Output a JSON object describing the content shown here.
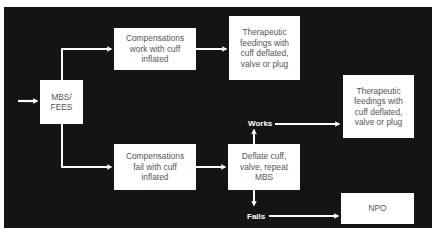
{
  "diagram": {
    "background_color": "#141414",
    "box_color": "#ffffff",
    "text_color": "#555555",
    "arrow_color": "#ffffff",
    "nodes": {
      "start": {
        "label": "MBS/\nFEES"
      },
      "comp_work": {
        "label": "Compensations\nwork with cuff\ninflated"
      },
      "thera_top": {
        "label": "Therapeutic\nfeedings with\ncuff deflated,\nvalve or plug"
      },
      "comp_fail": {
        "label": "Compensations\nfail with cuff\ninflated"
      },
      "deflate": {
        "label": "Deflate cuff,\nvalve, repeat\nMBS"
      },
      "thera_right": {
        "label": "Therapeutic\nfeedings with\ncuff deflated,\nvalve or plug"
      },
      "npo": {
        "label": "NPO"
      }
    },
    "edge_labels": {
      "works": "Works",
      "fails": "Fails"
    },
    "edges": [
      {
        "from": "entry",
        "to": "start"
      },
      {
        "from": "start",
        "to": "comp_work"
      },
      {
        "from": "start",
        "to": "comp_fail"
      },
      {
        "from": "comp_work",
        "to": "thera_top"
      },
      {
        "from": "comp_fail",
        "to": "deflate"
      },
      {
        "from": "deflate",
        "to": "thera_right",
        "label": "Works"
      },
      {
        "from": "deflate",
        "to": "npo",
        "label": "Fails"
      }
    ]
  }
}
